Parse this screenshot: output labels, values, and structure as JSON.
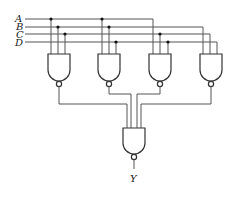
{
  "diagram": {
    "type": "logic-circuit",
    "inputs": [
      "A",
      "B",
      "C",
      "D"
    ],
    "output": "Y",
    "gates": [
      {
        "id": "nand1",
        "type": "NAND",
        "inputs": [
          "A",
          "B",
          "C"
        ]
      },
      {
        "id": "nand2",
        "type": "NAND",
        "inputs": [
          "A",
          "B",
          "D"
        ]
      },
      {
        "id": "nand3",
        "type": "NAND",
        "inputs": [
          "A",
          "C",
          "D"
        ]
      },
      {
        "id": "nand4",
        "type": "NAND",
        "inputs": [
          "B",
          "C",
          "D"
        ]
      },
      {
        "id": "nand_out",
        "type": "NAND",
        "inputs": [
          "nand1",
          "nand2",
          "nand3",
          "nand4"
        ],
        "output": "Y"
      }
    ]
  },
  "labels": {
    "a": "A",
    "b": "B",
    "c": "C",
    "d": "D",
    "y": "Y"
  }
}
